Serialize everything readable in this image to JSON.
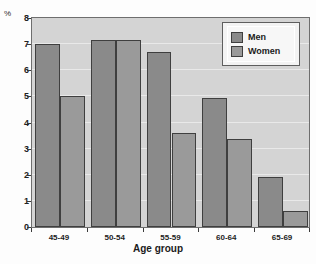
{
  "chart_data": {
    "type": "bar",
    "title": "",
    "subtitle": "",
    "xlabel": "Age group",
    "ylabel": "%",
    "categories": [
      "45-49",
      "50-54",
      "55-59",
      "60-64",
      "65-69"
    ],
    "series": [
      {
        "name": "Men",
        "values": [
          7.0,
          7.15,
          6.7,
          4.95,
          1.9
        ],
        "color": "#8a8a8a"
      },
      {
        "name": "Women",
        "values": [
          5.0,
          7.15,
          3.6,
          3.35,
          0.6
        ],
        "color": "#9a9a9a"
      }
    ],
    "ylim": [
      0,
      8
    ],
    "yticks": [
      0,
      1,
      2,
      3,
      4,
      5,
      6,
      7,
      8
    ],
    "ytick_labels": [
      "0",
      "1",
      "2",
      "3",
      "4",
      "5",
      "6",
      "7",
      "8"
    ],
    "grid": true,
    "grid_axis": "y",
    "legend_position": "top-right",
    "legend_entries": [
      "Men",
      "Women"
    ],
    "plot_background": "#d4d4d4",
    "figure_background": "#fdfdfd"
  },
  "axes": {
    "y_unit_label": "%",
    "x_title": "Age group"
  },
  "legend": {
    "items": [
      {
        "label": "Men"
      },
      {
        "label": "Women"
      }
    ]
  }
}
